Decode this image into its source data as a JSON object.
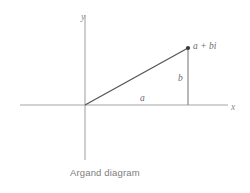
{
  "figure": {
    "caption": "Argand diagram",
    "background_color": "#ffffff"
  },
  "axes": {
    "x_label": "x",
    "y_label": "y",
    "axis_color": "#a6a6a6"
  },
  "labels": {
    "point": "a + bi",
    "horizontal_leg": "a",
    "vertical_leg": "b"
  },
  "colors": {
    "vector": "#585858",
    "drop_line": "#8a8a8a",
    "point": "#3a3a3a",
    "text": "#7d7d7d"
  },
  "geometry": {
    "origin_x": 85,
    "origin_y": 105,
    "point_x": 188,
    "point_y": 48
  }
}
